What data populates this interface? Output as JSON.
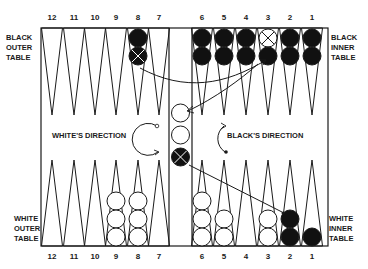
{
  "colors": {
    "line": "#1a1a1a",
    "black_checker": "#111111",
    "white_checker": "#ffffff",
    "background": "#ffffff"
  },
  "labels": {
    "black_outer": [
      "BLACK",
      "OUTER",
      "TABLE"
    ],
    "black_inner": [
      "BLACK",
      "INNER",
      "TABLE"
    ],
    "white_outer": [
      "WHITE",
      "OUTER",
      "TABLE"
    ],
    "white_inner": [
      "WHITE",
      "INNER",
      "TABLE"
    ],
    "white_direction": "WHITE'S DIRECTION",
    "black_direction": "BLACK'S DIRECTION"
  },
  "top_point_numbers": [
    "12",
    "11",
    "10",
    "9",
    "8",
    "7",
    "6",
    "5",
    "4",
    "3",
    "2",
    "1"
  ],
  "bottom_point_numbers": [
    "12",
    "11",
    "10",
    "9",
    "8",
    "7",
    "6",
    "5",
    "4",
    "3",
    "2",
    "1"
  ],
  "top_checkers": [
    {
      "point": "8",
      "stack": [
        "black",
        "black-x"
      ]
    },
    {
      "point": "6",
      "stack": [
        "black",
        "black"
      ]
    },
    {
      "point": "5",
      "stack": [
        "black",
        "black"
      ]
    },
    {
      "point": "4",
      "stack": [
        "black",
        "black"
      ]
    },
    {
      "point": "3",
      "stack": [
        "white-x",
        "black"
      ]
    },
    {
      "point": "2",
      "stack": [
        "black",
        "black"
      ]
    },
    {
      "point": "1",
      "stack": [
        "black",
        "black"
      ]
    }
  ],
  "bottom_checkers": [
    {
      "point": "9",
      "stack": [
        "white",
        "white",
        "white"
      ]
    },
    {
      "point": "8",
      "stack": [
        "white",
        "white",
        "white"
      ]
    },
    {
      "point": "6",
      "stack": [
        "white",
        "white",
        "white"
      ]
    },
    {
      "point": "5",
      "stack": [
        "white",
        "white"
      ]
    },
    {
      "point": "3",
      "stack": [
        "white",
        "white"
      ]
    },
    {
      "point": "2",
      "stack": [
        "black",
        "black"
      ]
    },
    {
      "point": "1",
      "stack": [
        "black"
      ]
    }
  ],
  "bar_checkers": [
    "white",
    "white",
    "black-x"
  ],
  "arrows": [
    {
      "from": "top point 8 (crossed black)",
      "to": "top point 3"
    },
    {
      "from": "top point 3",
      "to": "bar (white checker)"
    },
    {
      "from": "bar (crossed black)",
      "to": "bottom point 2"
    }
  ]
}
